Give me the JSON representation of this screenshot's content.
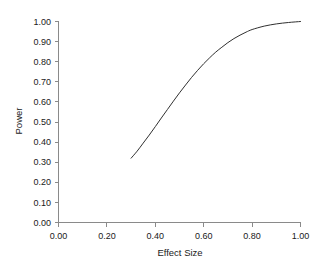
{
  "chart_data": {
    "type": "line",
    "title": "",
    "xlabel": "Effect Size",
    "ylabel": "Power",
    "xlim": [
      0.0,
      1.0
    ],
    "ylim": [
      0.0,
      1.0
    ],
    "grid": false,
    "legend": "none",
    "xticks": [
      "0.00",
      "0.20",
      "0.40",
      "0.60",
      "0.80",
      "1.00"
    ],
    "xtick_values": [
      0.0,
      0.2,
      0.4,
      0.6,
      0.8,
      1.0
    ],
    "yticks": [
      "0.00",
      "0.10",
      "0.20",
      "0.30",
      "0.40",
      "0.50",
      "0.60",
      "0.70",
      "0.80",
      "0.90",
      "1.00"
    ],
    "ytick_values": [
      0.0,
      0.1,
      0.2,
      0.3,
      0.4,
      0.5,
      0.6,
      0.7,
      0.8,
      0.9,
      1.0
    ],
    "series": [
      {
        "name": "Power curve",
        "color": "#303030",
        "x": [
          0.3,
          0.325,
          0.35,
          0.375,
          0.4,
          0.425,
          0.45,
          0.475,
          0.5,
          0.525,
          0.55,
          0.575,
          0.6,
          0.625,
          0.65,
          0.675,
          0.7,
          0.725,
          0.75,
          0.775,
          0.8,
          0.85,
          0.9,
          0.95,
          1.0
        ],
        "y": [
          0.32,
          0.355,
          0.395,
          0.435,
          0.477,
          0.52,
          0.562,
          0.604,
          0.645,
          0.684,
          0.722,
          0.757,
          0.79,
          0.82,
          0.848,
          0.872,
          0.895,
          0.915,
          0.932,
          0.947,
          0.96,
          0.977,
          0.988,
          0.995,
          1.0
        ]
      }
    ]
  },
  "axes": {
    "x_title": "Effect Size",
    "y_title": "Power"
  }
}
